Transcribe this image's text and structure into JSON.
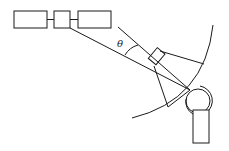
{
  "diagram": {
    "labels": {
      "angle": "θ"
    },
    "components": [
      {
        "name": "left-box"
      },
      {
        "name": "middle-box"
      },
      {
        "name": "right-box"
      },
      {
        "name": "beam-lines"
      },
      {
        "name": "detector-element"
      },
      {
        "name": "large-arc"
      },
      {
        "name": "sample-circles"
      },
      {
        "name": "base-block"
      }
    ]
  }
}
